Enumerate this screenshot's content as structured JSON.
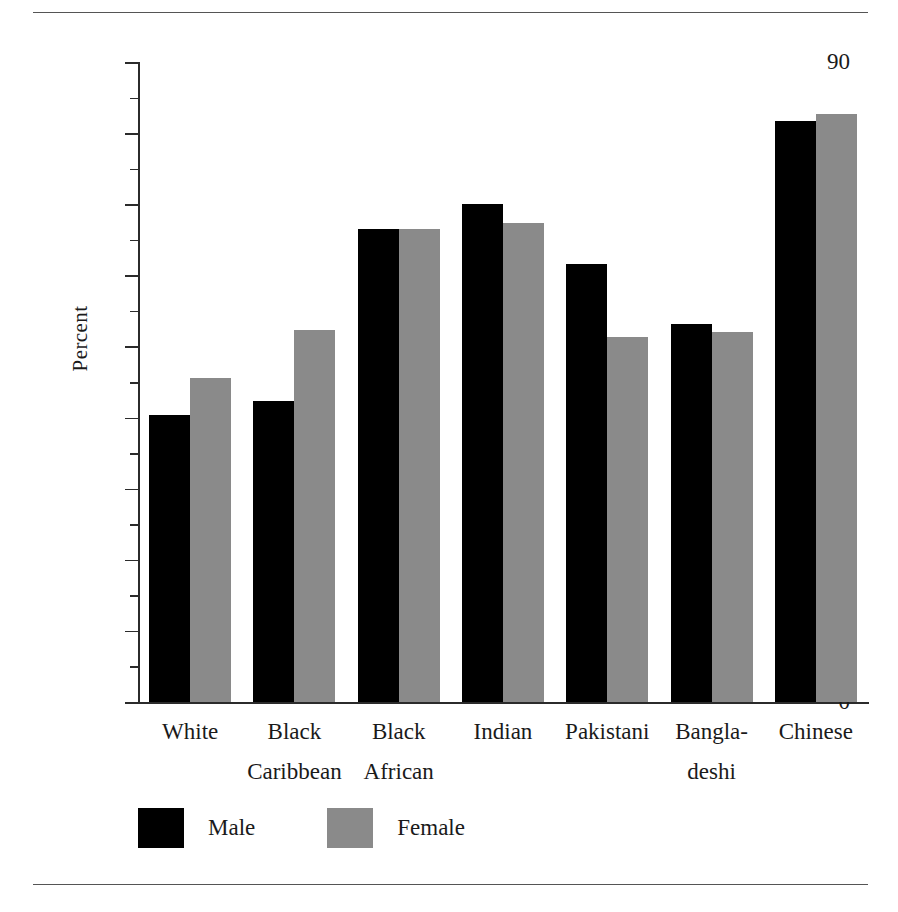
{
  "figure": {
    "y_axis_title": "Percent",
    "top_rule": "horizontal-rule",
    "bottom_rule": "horizontal-rule"
  },
  "legend": {
    "position": "bottom-left",
    "entries": [
      {
        "label": "Male",
        "color": "#000000",
        "swatch": "male-swatch"
      },
      {
        "label": "Female",
        "color": "#8a8a8a",
        "swatch": "female-swatch"
      }
    ]
  },
  "chart_data": {
    "type": "bar",
    "title": "",
    "subtitle": "",
    "xlabel": "",
    "ylabel": "Percent",
    "ylim": [
      0,
      90
    ],
    "ytick_values": [
      0,
      10,
      20,
      30,
      40,
      50,
      60,
      70,
      80,
      90
    ],
    "ytick_labels": [
      "0",
      "10",
      "20",
      "30",
      "40",
      "50",
      "60",
      "70",
      "80",
      "90"
    ],
    "yminor_values": [
      5,
      15,
      25,
      35,
      45,
      55,
      65,
      75,
      85
    ],
    "grid": false,
    "legend_position": "bottom-left",
    "categories": [
      "White",
      "Black Caribbean",
      "Black African",
      "Indian",
      "Pakistani",
      "Bangladeshi",
      "Chinese"
    ],
    "category_label_lines": [
      [
        "White",
        ""
      ],
      [
        "Black",
        "Caribbean"
      ],
      [
        "Black",
        "African"
      ],
      [
        "Indian",
        ""
      ],
      [
        "Pakistani",
        ""
      ],
      [
        "Bangla-",
        "deshi"
      ],
      [
        "Chinese",
        ""
      ]
    ],
    "series": [
      {
        "name": "Male",
        "color": "#000000",
        "values": [
          40.3,
          42.4,
          66.5,
          70.1,
          61.6,
          53.2,
          81.7
        ]
      },
      {
        "name": "Female",
        "color": "#8a8a8a",
        "values": [
          45.6,
          52.3,
          66.5,
          67.4,
          51.3,
          52.1,
          82.7
        ]
      }
    ]
  }
}
